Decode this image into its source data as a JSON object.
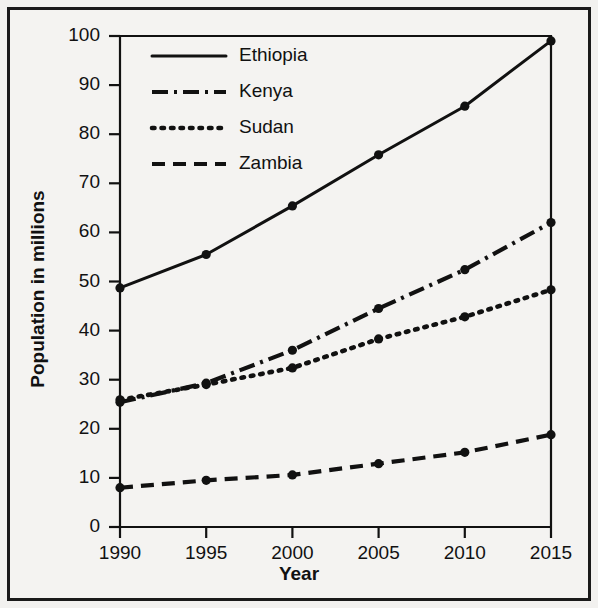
{
  "chart_data": {
    "type": "line",
    "title": "",
    "xlabel": "Year",
    "ylabel": "Population in millions",
    "x": [
      1990,
      1995,
      2000,
      2005,
      2010,
      2015
    ],
    "xtick_labels": [
      "1990",
      "1995",
      "2000",
      "2005",
      "2010",
      "2015"
    ],
    "ytick_labels": [
      "0",
      "10",
      "20",
      "30",
      "40",
      "50",
      "60",
      "70",
      "80",
      "90",
      "100"
    ],
    "yticks": [
      0,
      10,
      20,
      30,
      40,
      50,
      60,
      70,
      80,
      90,
      100
    ],
    "xlim": [
      1990,
      2015
    ],
    "ylim": [
      0,
      100
    ],
    "grid": false,
    "legend_position": "upper-left",
    "marker": "circle",
    "series": [
      {
        "name": "Ethiopia",
        "line_style": "solid",
        "color": "#111111",
        "values": [
          48.7,
          55.5,
          65.4,
          75.8,
          85.7,
          99.0
        ]
      },
      {
        "name": "Kenya",
        "line_style": "dashdot",
        "color": "#111111",
        "values": [
          25.4,
          29.3,
          36.0,
          44.5,
          52.4,
          62.0
        ]
      },
      {
        "name": "Sudan",
        "line_style": "dotted",
        "color": "#111111",
        "values": [
          25.9,
          29.0,
          32.4,
          38.3,
          42.8,
          48.3
        ]
      },
      {
        "name": "Zambia",
        "line_style": "dashed",
        "color": "#111111",
        "values": [
          8.0,
          9.5,
          10.6,
          12.9,
          15.2,
          18.8
        ]
      }
    ]
  },
  "axes": {
    "x_title": "Year",
    "y_title": "Population in millions"
  },
  "colors": {
    "ink": "#111111",
    "paper": "#f4f3f1",
    "frame": "#1a1a1a"
  }
}
